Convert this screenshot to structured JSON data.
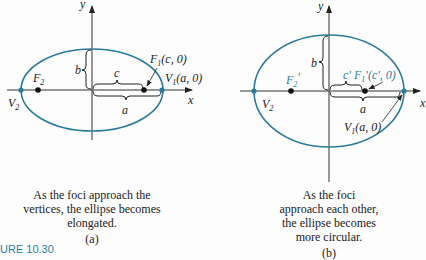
{
  "colors": {
    "ellipse": "#2b7a9e",
    "axis": "#333333",
    "accent": "#2a7fa0"
  },
  "panel_a": {
    "axis_labels": {
      "x": "x",
      "y": "y"
    },
    "labels": {
      "b": "b",
      "c": "c",
      "a": "a",
      "F2": "F",
      "F2_sub": "2",
      "F1": "F",
      "F1_sub": "1",
      "F1_coord": "(c, 0)",
      "V1": "V",
      "V1_sub": "1",
      "V1_coord": "(a, 0)",
      "V2": "V",
      "V2_sub": "2"
    },
    "caption": [
      "As the foci approach the",
      "vertices, the ellipse becomes",
      "elongated."
    ],
    "tag": "(a)"
  },
  "panel_b": {
    "axis_labels": {
      "x": "x",
      "y": "y"
    },
    "labels": {
      "b": "b",
      "c": "c'",
      "a": "a",
      "F2": "F",
      "F2_sub": "2",
      "F2_prime": "'",
      "F1": "F",
      "F1_sub": "1",
      "F1_coord": "'(c', 0)",
      "V1": "V",
      "V1_sub": "1",
      "V1_coord": "(a, 0)",
      "V2": "V",
      "V2_sub": "2"
    },
    "caption": [
      "As the foci",
      "approach each other,",
      "the ellipse becomes",
      "more circular."
    ],
    "tag": "(b)"
  },
  "figure_id": "URE 10.30"
}
